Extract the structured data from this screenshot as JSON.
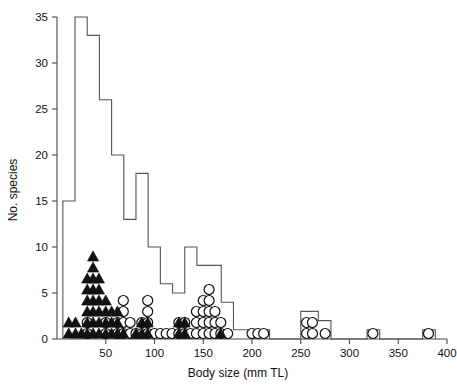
{
  "chart_data": {
    "type": "bar",
    "title": "",
    "subtitle": "",
    "xlabel": "Body size (mm TL)",
    "ylabel": "No. species",
    "xlim": [
      0,
      400
    ],
    "ylim": [
      0,
      35
    ],
    "grid": false,
    "legend_position": "none",
    "xticks": [
      50,
      100,
      150,
      200,
      250,
      300,
      350,
      400
    ],
    "yticks": [
      0,
      5,
      10,
      15,
      20,
      25,
      30,
      35
    ],
    "bin_width": 12.5,
    "histogram_note": "Open step outline (unfilled) histogram of number of species per body-size bin",
    "bins": [
      {
        "x0": 6,
        "x1": 18.5,
        "value": 15
      },
      {
        "x0": 18.5,
        "x1": 31,
        "value": 35
      },
      {
        "x0": 31,
        "x1": 43.5,
        "value": 33
      },
      {
        "x0": 43.5,
        "x1": 56,
        "value": 26
      },
      {
        "x0": 56,
        "x1": 68.5,
        "value": 20
      },
      {
        "x0": 68.5,
        "x1": 81,
        "value": 13
      },
      {
        "x0": 81,
        "x1": 93.5,
        "value": 18
      },
      {
        "x0": 93.5,
        "x1": 106,
        "value": 10
      },
      {
        "x0": 106,
        "x1": 118.5,
        "value": 6
      },
      {
        "x0": 118.5,
        "x1": 131,
        "value": 5
      },
      {
        "x0": 131,
        "x1": 143.5,
        "value": 10
      },
      {
        "x0": 143.5,
        "x1": 156,
        "value": 8
      },
      {
        "x0": 156,
        "x1": 168.5,
        "value": 8
      },
      {
        "x0": 168.5,
        "x1": 181,
        "value": 4
      },
      {
        "x0": 181,
        "x1": 218,
        "value": 1
      },
      {
        "x0": 218,
        "x1": 250,
        "value": 0
      },
      {
        "x0": 250,
        "x1": 268,
        "value": 3
      },
      {
        "x0": 268,
        "x1": 281,
        "value": 2
      },
      {
        "x0": 281,
        "x1": 318,
        "value": 0
      },
      {
        "x0": 318,
        "x1": 331,
        "value": 1
      },
      {
        "x0": 331,
        "x1": 375,
        "value": 0
      },
      {
        "x0": 375,
        "x1": 388,
        "value": 1
      }
    ],
    "marker_series": [
      {
        "name": "filled-triangle",
        "marker": "triangle",
        "fill": "#111111",
        "note": "Stacked solid triangles; each point is one species plotted at its body size",
        "stacks": [
          {
            "x": 12,
            "count": 2
          },
          {
            "x": 19,
            "count": 2
          },
          {
            "x": 25,
            "count": 1
          },
          {
            "x": 31,
            "count": 6
          },
          {
            "x": 37,
            "count": 8
          },
          {
            "x": 43,
            "count": 6
          },
          {
            "x": 50,
            "count": 4
          },
          {
            "x": 56,
            "count": 3
          },
          {
            "x": 62,
            "count": 3
          },
          {
            "x": 68,
            "count": 1
          },
          {
            "x": 81,
            "count": 1
          },
          {
            "x": 87,
            "count": 2
          },
          {
            "x": 93,
            "count": 2
          },
          {
            "x": 125,
            "count": 2
          },
          {
            "x": 131,
            "count": 2
          },
          {
            "x": 168,
            "count": 1
          }
        ]
      },
      {
        "name": "open-circle",
        "marker": "circle",
        "fill": "none",
        "stroke": "#111111",
        "note": "Stacked open circles; each point is one species plotted at its body size",
        "stacks": [
          {
            "x": 31,
            "count": 2
          },
          {
            "x": 50,
            "count": 2
          },
          {
            "x": 62,
            "count": 2
          },
          {
            "x": 68,
            "count": 4
          },
          {
            "x": 75,
            "count": 2
          },
          {
            "x": 81,
            "count": 1
          },
          {
            "x": 87,
            "count": 2
          },
          {
            "x": 93,
            "count": 4
          },
          {
            "x": 100,
            "count": 1
          },
          {
            "x": 106,
            "count": 1
          },
          {
            "x": 112,
            "count": 1
          },
          {
            "x": 118,
            "count": 1
          },
          {
            "x": 125,
            "count": 2
          },
          {
            "x": 131,
            "count": 2
          },
          {
            "x": 137,
            "count": 1
          },
          {
            "x": 143,
            "count": 3
          },
          {
            "x": 150,
            "count": 4
          },
          {
            "x": 156,
            "count": 5
          },
          {
            "x": 162,
            "count": 3
          },
          {
            "x": 168,
            "count": 2
          },
          {
            "x": 175,
            "count": 1
          },
          {
            "x": 200,
            "count": 1
          },
          {
            "x": 206,
            "count": 1
          },
          {
            "x": 212,
            "count": 1
          },
          {
            "x": 256,
            "count": 2
          },
          {
            "x": 262,
            "count": 2
          },
          {
            "x": 275,
            "count": 1
          },
          {
            "x": 324,
            "count": 1
          },
          {
            "x": 381,
            "count": 1
          }
        ]
      }
    ]
  }
}
